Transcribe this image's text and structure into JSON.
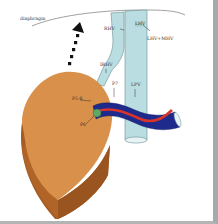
{
  "diagram": {
    "type": "anatomical-illustration",
    "labels": {
      "diaphragm": "diaphragm",
      "rhv": "RHV",
      "lhv": "LHV",
      "lhv_mhv": "LHV+MHV",
      "irhv": "IRHV",
      "p7": "P7",
      "lpv": "LPV",
      "p5_8": "P5-8",
      "p6": "P6"
    },
    "arrow": {
      "style": "dotted",
      "direction": "up-left",
      "meaning": "cranial rotation"
    },
    "colors": {
      "liver_front": "#d9904a",
      "liver_side": "#a65c22",
      "ivc": "#b9dde0",
      "portal_vein": "#1e2a8c",
      "artery": "#d8342a",
      "nodule": "#5fa86a",
      "border_right": "#a9a9a9",
      "border_bottom": "#b4b4b4"
    }
  }
}
